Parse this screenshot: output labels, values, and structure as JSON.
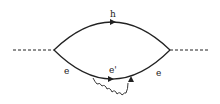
{
  "diagram": {
    "type": "feynman-diagram",
    "labels": {
      "top_line": "h",
      "bottom_left": "e",
      "bottom_middle": "e'",
      "bottom_right": "e"
    },
    "colors": {
      "line": "#222222",
      "background": "#ffffff"
    }
  }
}
